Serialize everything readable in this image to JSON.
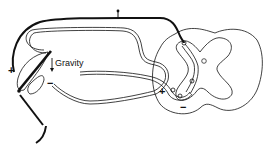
{
  "diagram": {
    "labels": {
      "gravity": "Gravity",
      "plus_limb": "+",
      "minus_limb": "−",
      "plus_cord": "+",
      "minus_cord": "−"
    },
    "colors": {
      "stroke": "#111111",
      "background": "#ffffff"
    },
    "components": [
      "limb-with-muscles",
      "nerve-loop",
      "efferent-nerve",
      "spinal-cord-cross-section"
    ]
  }
}
